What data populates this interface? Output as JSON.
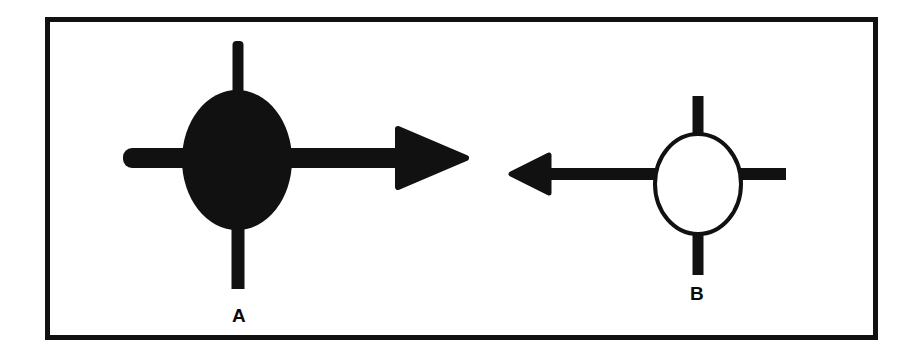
{
  "figure": {
    "background_color": "#ffffff",
    "ink_color": "#111111",
    "frame": {
      "name": "figure-border",
      "x": 45,
      "y": 17,
      "width": 833,
      "height": 323,
      "stroke_width": 5,
      "color": "#111111"
    },
    "panels": [
      {
        "id": "A",
        "label": "A",
        "label_x": 239,
        "label_y": 316,
        "symbol": "filled-ellipse-with-cross-arrow",
        "fill": "solid",
        "fill_color": "#111111",
        "ellipse": {
          "cx": 237,
          "cy": 160,
          "rx": 54,
          "ry": 70
        },
        "vertical_stem_top": {
          "x": 238,
          "y1": 41,
          "y2": 100,
          "width": 11
        },
        "vertical_stem_bottom": {
          "x": 238,
          "y1": 220,
          "y2": 289,
          "width": 13
        },
        "horizontal_shaft": {
          "x1": 123,
          "x2": 405,
          "y": 158,
          "thickness": 20
        },
        "arrowhead": {
          "direction": "right",
          "tip_x": 466,
          "base_x": 398,
          "half_height": 29
        }
      },
      {
        "id": "B",
        "label": "B",
        "label_x": 697,
        "label_y": 294,
        "symbol": "open-ellipse-with-cross-arrow",
        "fill": "none",
        "stroke_color": "#111111",
        "ellipse": {
          "cx": 698,
          "cy": 184,
          "rx": 44,
          "ry": 50,
          "stroke_width": 4
        },
        "vertical_stem_top": {
          "x": 698,
          "y1": 96,
          "y2": 140,
          "width": 10
        },
        "vertical_stem_bottom": {
          "x": 698,
          "y1": 228,
          "y2": 275,
          "width": 10
        },
        "horizontal_shaft_left": {
          "x1": 540,
          "x2": 662,
          "y": 174,
          "thickness": 12
        },
        "horizontal_shaft_right": {
          "x1": 736,
          "x2": 786,
          "y": 174,
          "thickness": 12
        },
        "arrowhead": {
          "direction": "left",
          "tip_x": 511,
          "base_x": 548,
          "half_height": 19
        }
      }
    ]
  }
}
